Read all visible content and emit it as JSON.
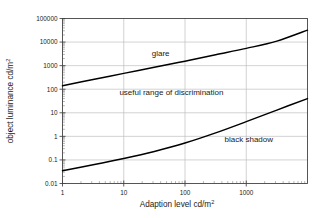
{
  "chart_data": {
    "type": "line",
    "title": "",
    "xlabel": "Adaption level cd/m2",
    "xlabel_base": "Adaption level cd/m",
    "xlabel_sup": "2",
    "ylabel": "object luminance cd/m2",
    "ylabel_base": "object luminance cd/m",
    "ylabel_sup": "2",
    "xscale": "log",
    "yscale": "log",
    "xlim": [
      1,
      10000
    ],
    "ylim": [
      0.01,
      100000
    ],
    "grid": true,
    "legend": "none",
    "xticks": [
      "1",
      "10",
      "100",
      "1000"
    ],
    "xtick_values": [
      1,
      10,
      100,
      1000
    ],
    "yticks": [
      "100000",
      "10000",
      "1000",
      "100",
      "10",
      "1",
      "0.1",
      "0.01"
    ],
    "ytick_values": [
      100000,
      10000,
      1000,
      100,
      10,
      1,
      0.1,
      0.01
    ],
    "series": [
      {
        "name": "glare threshold",
        "color": "#000000",
        "x": [
          1,
          3.16,
          10,
          31.6,
          100,
          316,
          1000,
          3160,
          10000
        ],
        "y": [
          140,
          260,
          470,
          850,
          1550,
          2900,
          5400,
          11000,
          32000
        ]
      },
      {
        "name": "black shadow threshold",
        "color": "#000000",
        "x": [
          1,
          3.16,
          10,
          31.6,
          100,
          316,
          1000,
          3160,
          10000
        ],
        "y": [
          0.035,
          0.062,
          0.115,
          0.23,
          0.52,
          1.4,
          4.2,
          13.0,
          40.0
        ]
      }
    ],
    "annotations": [
      {
        "text": "glare",
        "x": 40,
        "y": 2600,
        "name": "annotation-glare"
      },
      {
        "text": "useful range of discrimination",
        "x": 60,
        "y": 55,
        "name": "annotation-useful-range"
      },
      {
        "text": "black shadow",
        "x": 1100,
        "y": 0.55,
        "name": "annotation-black-shadow"
      }
    ],
    "colors": {
      "curve": "#000000",
      "grid": "#bfbfbf",
      "frame": "#444444",
      "text": "#1a1a1a",
      "background": "#ffffff"
    }
  }
}
